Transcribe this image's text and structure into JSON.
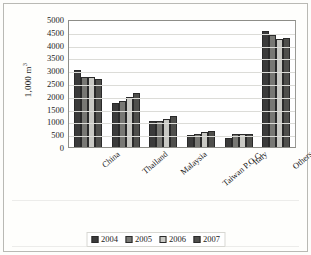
{
  "chart_data": {
    "type": "bar",
    "title": "",
    "xlabel": "",
    "ylabel": "1,000 m",
    "ylabel_superscript": "3",
    "categories": [
      "China",
      "Thailand",
      "Malaysia",
      "Taiwan P.O.C.",
      "Italy",
      "Others"
    ],
    "series": [
      {
        "name": "2004",
        "color": "#3b3b3b",
        "values": [
          2990,
          1700,
          1020,
          480,
          350,
          4550
        ]
      },
      {
        "name": "2005",
        "color": "#787874",
        "values": [
          2720,
          1800,
          1000,
          510,
          500,
          4380
        ]
      },
      {
        "name": "2006",
        "color": "#c9c9c4",
        "values": [
          2720,
          1960,
          1080,
          570,
          500,
          4200
        ]
      },
      {
        "name": "2007",
        "color": "#4f4f4c",
        "values": [
          2670,
          2100,
          1230,
          610,
          500,
          4260
        ]
      }
    ],
    "ylim": [
      0,
      5000
    ],
    "yticks": [
      0,
      500,
      1000,
      1500,
      2000,
      2500,
      3000,
      3500,
      4000,
      4500,
      5000
    ],
    "ytick_labels": [
      "0",
      "500",
      "1000",
      "1500",
      "2000",
      "2500",
      "3000",
      "3500",
      "4000",
      "4500",
      "5000"
    ],
    "grid": true,
    "legend_position": "bottom",
    "legend_entries": [
      "2004",
      "2005",
      "2006",
      "2007"
    ]
  }
}
